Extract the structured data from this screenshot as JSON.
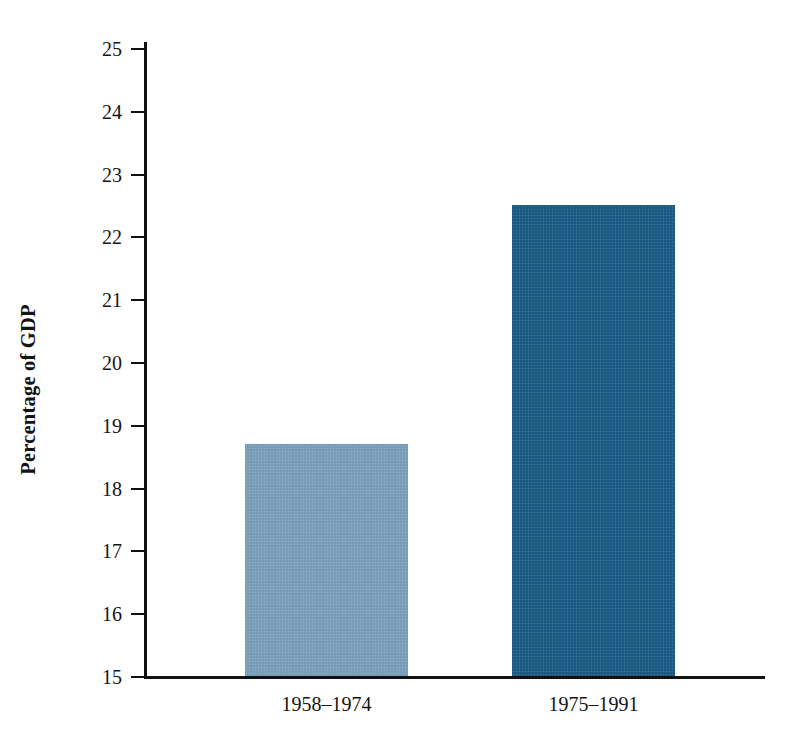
{
  "chart_data": {
    "type": "bar",
    "title": "",
    "subtitle": "",
    "xlabel": "",
    "ylabel": "Percentage of GDP",
    "categories": [
      "1958–1974",
      "1975–1991"
    ],
    "values": [
      18.7,
      22.5
    ],
    "series": [
      {
        "name": "Percentage of GDP",
        "values": [
          18.7,
          22.5
        ]
      }
    ],
    "ylim": [
      15,
      25
    ],
    "yticks": [
      15,
      16,
      17,
      18,
      19,
      20,
      21,
      22,
      23,
      24,
      25
    ],
    "ytick_labels": [
      "15",
      "16",
      "17",
      "18",
      "19",
      "20",
      "21",
      "22",
      "23",
      "24",
      "25"
    ],
    "grid": false,
    "legend": false,
    "legend_position": "none",
    "bar_colors": [
      "#7ba0bb",
      "#1d5c84"
    ],
    "background_color": "#ffffff",
    "axis_color": "#111111"
  },
  "axes": {
    "y_title": "Percentage of GDP"
  }
}
